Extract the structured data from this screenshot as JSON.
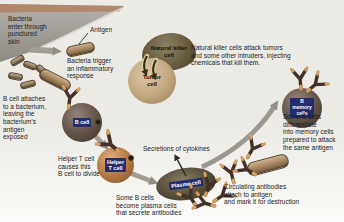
{
  "annotations": {
    "bacteria_enter": "Bacteria\nenter through\npunctured\nskin",
    "antigen": "Antigen",
    "bacteria_trigger": "Bacteria trigger\nan inflammatory\nresponse",
    "b_cell_attaches": "B cell attaches\nto a bacterium,\nleaving the\nbacterium's\nantigen\nexposed",
    "helper_t_causes": "Helper T cell\ncauses this\nB cell to divide",
    "secretions": "Secretions of cytokines",
    "some_b_plasma": "Some B cells\nbecome plasma cells\nthat secrete antibodies",
    "circulating": "Circulating antibodies\nattach to antigen\nand mark it for destruction",
    "nk_attack": "Natural killer cells attack tumors\nand some other intruders, injecting\nchemicals that kill them.",
    "some_b_memory": "Some B cells\ndifferentiate\ninto memory cells\nprepared to attack\nthe same antigen"
  },
  "cells": {
    "b_cell": "B cell",
    "helper_t": "Helper\nT cell",
    "plasma": "Plasma cell",
    "nk": "Natural killer\ncell",
    "tumor": "Tumor\ncell",
    "memory": "B\nmemory\ncells"
  },
  "colors": {
    "background_top": "#edebe6",
    "background_bottom": "#fbfbf9",
    "label_box": "#232d6e",
    "label_text": "#ffffff",
    "arrow_gray": "#9b988f",
    "skin_top": "#b3886a",
    "skin_body": "#a3a09a",
    "antibody": "#43312a",
    "antibody_tip": "#d3a05f",
    "text": "#1c1c1a"
  }
}
